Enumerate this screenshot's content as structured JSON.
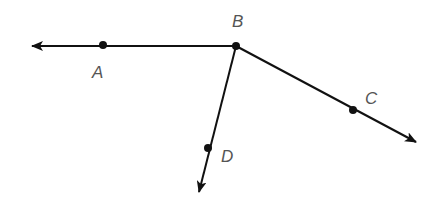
{
  "diagram": {
    "type": "rays",
    "stroke_color": "#111111",
    "label_color": "#555555",
    "points": [
      {
        "name": "A",
        "x": 103,
        "y": 45,
        "label_x": 92,
        "label_y": 78
      },
      {
        "name": "B",
        "x": 236,
        "y": 46,
        "label_x": 232,
        "label_y": 27
      },
      {
        "name": "C",
        "x": 353,
        "y": 110,
        "label_x": 365,
        "label_y": 104
      },
      {
        "name": "D",
        "x": 208,
        "y": 148,
        "label_x": 221,
        "label_y": 162
      }
    ],
    "rays": [
      {
        "name": "ray-BA",
        "from": "B",
        "through": "A",
        "end_x": 30,
        "end_y": 46
      },
      {
        "name": "ray-BC",
        "from": "B",
        "through": "C",
        "end_x": 418,
        "end_y": 143
      },
      {
        "name": "ray-BD",
        "from": "B",
        "through": "D",
        "end_x": 198,
        "end_y": 194
      }
    ]
  }
}
